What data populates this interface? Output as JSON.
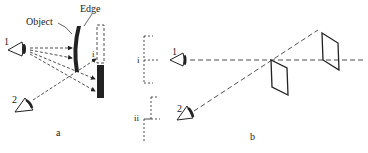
{
  "panel_a": {
    "caption": "a",
    "labels": {
      "object": "Object",
      "edge": "Edge",
      "eye1": "1",
      "eye2": "2",
      "image": "i"
    }
  },
  "panel_b": {
    "caption": "b",
    "labels": {
      "eye1": "1",
      "eye2": "2",
      "image_i": "i",
      "image_ii": "ii"
    }
  },
  "colors": {
    "ink": "#222222",
    "background": "#ffffff"
  }
}
